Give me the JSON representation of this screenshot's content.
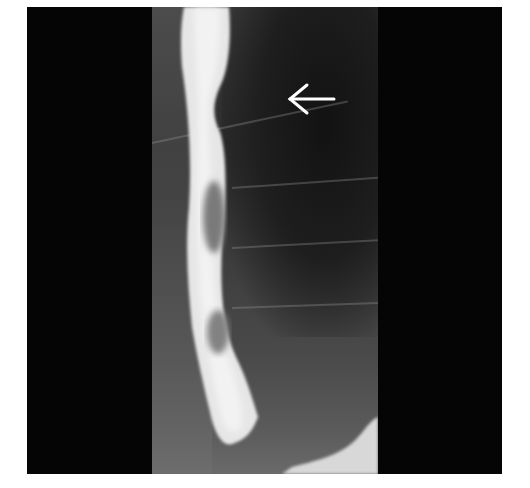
{
  "image": {
    "type": "barium-swallow-xray",
    "description": "Fluoroscopic barium esophagram showing contrast-filled esophagus with filling defects, arrow pointing to mediastinal region",
    "annotation": {
      "arrow_direction": "left",
      "arrow_color": "#ffffff"
    },
    "colors": {
      "background": "#ffffff",
      "frame": "#050505",
      "contrast": "#eeeeee",
      "soft_tissue": "#3a3a3a"
    }
  }
}
